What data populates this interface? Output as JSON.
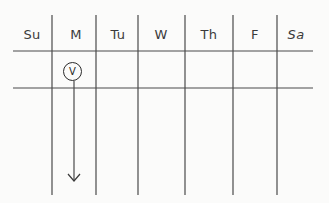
{
  "calendar": {
    "days": [
      {
        "label": "Su",
        "x": 32
      },
      {
        "label": "M",
        "x": 76
      },
      {
        "label": "Tu",
        "x": 118
      },
      {
        "label": "W",
        "x": 161
      },
      {
        "label": "Th",
        "x": 209
      },
      {
        "label": "F",
        "x": 255
      },
      {
        "label": "Sa",
        "x": 296
      }
    ],
    "marker": {
      "label": "V",
      "day": "M"
    }
  },
  "colors": {
    "line": "#3a3a3a",
    "background": "#fbfbfa"
  }
}
